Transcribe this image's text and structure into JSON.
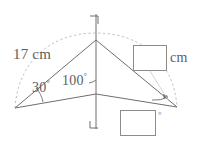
{
  "figure": {
    "type": "geometry-diagram",
    "background_color": "#ffffff",
    "stroke_color": "#6e6e6e",
    "dashed_color": "#b4b4b4",
    "box_border_color": "#8c8c8c",
    "text_color": "#5e5e5e"
  },
  "labels": {
    "side_17cm": "17 cm",
    "angle_30": "30",
    "angle_100": "100",
    "degree_symbol": "°",
    "unit_cm": "cm",
    "angle_box_degree": "°"
  },
  "answer_boxes": [
    {
      "name": "length-answer-box",
      "value": "",
      "unit": "cm",
      "position": "right-upper"
    },
    {
      "name": "angle-answer-box",
      "value": "",
      "unit": "°",
      "position": "bottom-right"
    }
  ],
  "geometry": {
    "vertices": {
      "left": [
        15,
        108
      ],
      "apex": [
        96,
        40
      ],
      "right": [
        177,
        107
      ],
      "base_mid": [
        96,
        94
      ]
    },
    "vertical_line": {
      "x": 96,
      "top_y": 14,
      "bottom_y": 129
    },
    "corner_marks": {
      "top": "top-right-corner-bracket",
      "bottom": "bottom-left-corner-bracket"
    },
    "arc": {
      "style": "dashed",
      "from": [
        15,
        108
      ],
      "to": [
        177,
        107
      ],
      "through_top": [
        96,
        33
      ]
    }
  }
}
